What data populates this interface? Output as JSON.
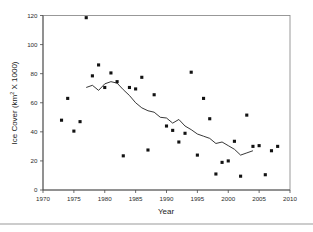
{
  "chart_data": {
    "type": "scatter",
    "title": "",
    "subtitle": "",
    "xlabel": "Year",
    "ylabel": "Ice Cover (km² X 1000)",
    "ylabel_parts": {
      "pre": "Ice Cover (km",
      "sup": "2",
      "post": " X 1000)"
    },
    "xlim": [
      1970,
      2010
    ],
    "ylim": [
      0,
      120
    ],
    "xticks": [
      1970,
      1975,
      1980,
      1985,
      1990,
      1995,
      2000,
      2005,
      2010
    ],
    "xtick_labels": [
      "1970",
      "1975",
      "1980",
      "1985",
      "1990",
      "1995",
      "2000",
      "2005",
      "2010"
    ],
    "yticks": [
      0,
      20,
      40,
      60,
      80,
      100,
      120
    ],
    "ytick_labels": [
      "0",
      "20",
      "40",
      "60",
      "80",
      "100",
      "120"
    ],
    "grid": false,
    "legend": false,
    "legend_position": "none",
    "marker_color": "#121212",
    "line_color": "#141414",
    "frame_color": "#8e8e8e",
    "series": [
      {
        "name": "Annual ice cover",
        "type": "scatter",
        "marker": "filled-square",
        "x": [
          1973,
          1974,
          1975,
          1976,
          1977,
          1978,
          1979,
          1980,
          1981,
          1982,
          1983,
          1984,
          1985,
          1986,
          1987,
          1988,
          1990,
          1991,
          1992,
          1993,
          1994,
          1995,
          1996,
          1997,
          1998,
          1999,
          2000,
          2001,
          2002,
          2003,
          2004,
          2005,
          2006,
          2007,
          2008
        ],
        "values": [
          48,
          63,
          40.5,
          47,
          118.5,
          78.5,
          86,
          70.5,
          80.5,
          74.5,
          23.5,
          70.5,
          69.5,
          77.5,
          27.5,
          65.5,
          44,
          41,
          33,
          39,
          81,
          24,
          63,
          49,
          11,
          19,
          20,
          33.5,
          9.5,
          51.5,
          30,
          30.5,
          10.5,
          27,
          30
        ]
      },
      {
        "name": "Running mean",
        "type": "line",
        "x": [
          1977,
          1978,
          1979,
          1980,
          1981,
          1982,
          1983,
          1984,
          1985,
          1986,
          1987,
          1988,
          1989,
          1990,
          1991,
          1992,
          1993,
          1994,
          1995,
          1996,
          1997,
          1998,
          1999,
          2000,
          2001,
          2002,
          2003,
          2004
        ],
        "values": [
          70.5,
          72,
          68.5,
          73,
          74.5,
          73.5,
          69,
          65,
          60,
          56.5,
          54.5,
          53.5,
          50,
          49.5,
          46,
          48.5,
          44,
          41.5,
          38.5,
          37,
          35.5,
          32,
          33,
          30.5,
          28,
          24,
          25.5,
          27
        ]
      }
    ]
  }
}
